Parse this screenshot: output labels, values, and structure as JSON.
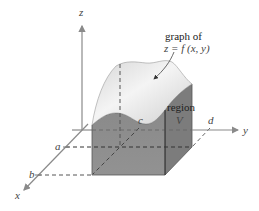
{
  "diagram": {
    "axes": {
      "x_label": "x",
      "y_label": "y",
      "z_label": "z"
    },
    "bounds": {
      "a": "a",
      "b": "b",
      "c": "c",
      "d": "d"
    },
    "annotation": {
      "line1": "graph of",
      "line2": "z = f (x, y)"
    },
    "region": {
      "line1": "region",
      "line2": "V"
    },
    "colors": {
      "axis": "#8a8a8a",
      "front_face": "#8c8c8c",
      "side_face": "#7a7a7a",
      "surface_light": "#f2f2f2",
      "surface_shade": "#c8c8c8",
      "dash": "#555555"
    }
  }
}
